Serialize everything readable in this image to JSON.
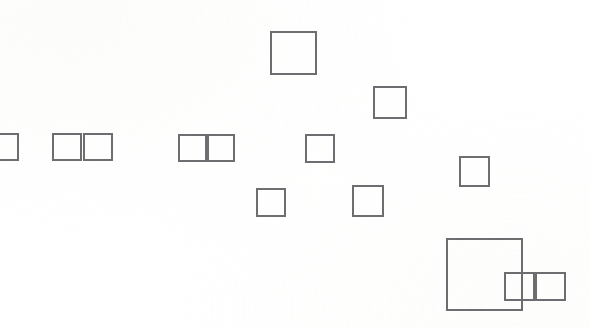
{
  "canvas": {
    "width": 590,
    "height": 328,
    "background_color": "#ffffff",
    "stroke_color": "#6e6e72",
    "stroke_width": 2
  },
  "chart_data": {
    "type": "scatter",
    "title": "",
    "subtitle": "",
    "xlabel": "",
    "ylabel": "",
    "xlim": [
      0,
      590
    ],
    "ylim": [
      0,
      328
    ],
    "grid": false,
    "legend": null,
    "annotations": [],
    "tick_labels": {
      "x": [],
      "y": []
    },
    "series": [
      {
        "name": "bounding-boxes",
        "color": "#6e6e72",
        "values": [
          {
            "id": 1,
            "label": "",
            "x": -5,
            "y": 133,
            "w": 24,
            "h": 28,
            "clipped": "left-edge"
          },
          {
            "id": 2,
            "label": "",
            "x": 52,
            "y": 133,
            "w": 30,
            "h": 28,
            "clipped": "none"
          },
          {
            "id": 3,
            "label": "",
            "x": 83,
            "y": 133,
            "w": 30,
            "h": 28,
            "clipped": "none"
          },
          {
            "id": 4,
            "label": "",
            "x": 178,
            "y": 134,
            "w": 29,
            "h": 28,
            "clipped": "none"
          },
          {
            "id": 5,
            "label": "",
            "x": 207,
            "y": 134,
            "w": 28,
            "h": 28,
            "clipped": "none"
          },
          {
            "id": 6,
            "label": "",
            "x": 270,
            "y": 31,
            "w": 47,
            "h": 44,
            "clipped": "none"
          },
          {
            "id": 7,
            "label": "",
            "x": 373,
            "y": 86,
            "w": 34,
            "h": 33,
            "clipped": "none"
          },
          {
            "id": 8,
            "label": "",
            "x": 305,
            "y": 134,
            "w": 30,
            "h": 29,
            "clipped": "none"
          },
          {
            "id": 9,
            "label": "",
            "x": 459,
            "y": 156,
            "w": 31,
            "h": 31,
            "clipped": "none"
          },
          {
            "id": 10,
            "label": "",
            "x": 256,
            "y": 188,
            "w": 30,
            "h": 29,
            "clipped": "none"
          },
          {
            "id": 11,
            "label": "",
            "x": 352,
            "y": 185,
            "w": 32,
            "h": 32,
            "clipped": "none"
          },
          {
            "id": 12,
            "label": "",
            "x": 446,
            "y": 238,
            "w": 77,
            "h": 73,
            "clipped": "none"
          },
          {
            "id": 13,
            "label": "",
            "x": 504,
            "y": 272,
            "w": 31,
            "h": 29,
            "clipped": "none"
          },
          {
            "id": 14,
            "label": "",
            "x": 535,
            "y": 272,
            "w": 31,
            "h": 29,
            "clipped": "none"
          }
        ]
      }
    ],
    "count": 14
  }
}
